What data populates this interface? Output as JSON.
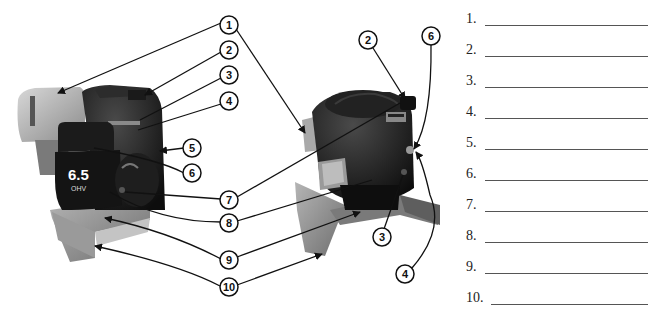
{
  "figure": {
    "left_engine": {
      "name": "horizontal-shaft engine",
      "badge_main": "6.5",
      "badge_sub": "OHV"
    },
    "right_engine": {
      "name": "vertical-shaft engine"
    },
    "callouts": [
      {
        "label": "1",
        "x": 229,
        "y": 25
      },
      {
        "label": "2",
        "x": 229,
        "y": 50
      },
      {
        "label": "3",
        "x": 229,
        "y": 75
      },
      {
        "label": "4",
        "x": 229,
        "y": 101
      },
      {
        "label": "5",
        "x": 192,
        "y": 148
      },
      {
        "label": "6",
        "x": 192,
        "y": 173
      },
      {
        "label": "7",
        "x": 229,
        "y": 200
      },
      {
        "label": "8",
        "x": 229,
        "y": 223
      },
      {
        "label": "9",
        "x": 229,
        "y": 260
      },
      {
        "label": "10",
        "x": 229,
        "y": 287
      },
      {
        "label": "2",
        "x": 368,
        "y": 40
      },
      {
        "label": "6",
        "x": 431,
        "y": 36
      },
      {
        "label": "3",
        "x": 382,
        "y": 237
      },
      {
        "label": "4",
        "x": 405,
        "y": 274
      }
    ]
  },
  "answers": [
    {
      "num": "1.",
      "value": ""
    },
    {
      "num": "2.",
      "value": ""
    },
    {
      "num": "3.",
      "value": ""
    },
    {
      "num": "4.",
      "value": ""
    },
    {
      "num": "5.",
      "value": ""
    },
    {
      "num": "6.",
      "value": ""
    },
    {
      "num": "7.",
      "value": ""
    },
    {
      "num": "8.",
      "value": ""
    },
    {
      "num": "9.",
      "value": ""
    },
    {
      "num": "10.",
      "value": ""
    }
  ]
}
